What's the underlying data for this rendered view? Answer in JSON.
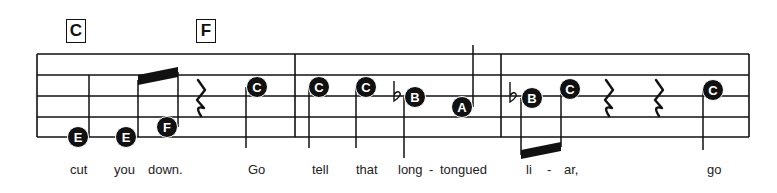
{
  "chords": [
    {
      "label": "C",
      "x": 66,
      "y": 19
    },
    {
      "label": "F",
      "x": 196,
      "y": 19
    }
  ],
  "staff": {
    "left": 37,
    "right": 749,
    "lines_y": [
      54,
      75,
      96,
      117,
      137
    ],
    "barlines_x": [
      37,
      295,
      501,
      749
    ]
  },
  "notes": [
    {
      "name": "E",
      "x": 78,
      "y": 137,
      "stem_x": 89,
      "stem_from": 137,
      "stem_to": 75
    },
    {
      "name": "E",
      "x": 126,
      "y": 137,
      "stem_x": 138,
      "stem_from": 137,
      "stem_to": 80
    },
    {
      "name": "F",
      "x": 167,
      "y": 127,
      "stem_x": 178,
      "stem_from": 127,
      "stem_to": 72
    },
    {
      "name": "C",
      "x": 257,
      "y": 87,
      "stem_x": 246,
      "stem_from": 87,
      "stem_to": 148
    },
    {
      "name": "C",
      "x": 319,
      "y": 87,
      "stem_x": 309,
      "stem_from": 87,
      "stem_to": 148
    },
    {
      "name": "C",
      "x": 366,
      "y": 87,
      "stem_x": 356,
      "stem_from": 87,
      "stem_to": 148
    },
    {
      "name": "B",
      "x": 415,
      "y": 97,
      "stem_x": 404,
      "stem_from": 97,
      "stem_to": 158,
      "flat": true,
      "flat_x": 394
    },
    {
      "name": "A",
      "x": 462,
      "y": 107,
      "stem_x": 473,
      "stem_from": 107,
      "stem_to": 45
    },
    {
      "name": "B",
      "x": 532,
      "y": 98,
      "stem_x": 521,
      "stem_from": 98,
      "stem_to": 155,
      "flat": true,
      "flat_x": 510
    },
    {
      "name": "C",
      "x": 570,
      "y": 89,
      "stem_x": 561,
      "stem_from": 89,
      "stem_to": 147
    },
    {
      "name": "C",
      "x": 713,
      "y": 90,
      "stem_x": 703,
      "stem_from": 90,
      "stem_to": 150
    }
  ],
  "beams": [
    {
      "x1": 138,
      "y1": 75,
      "x2": 178,
      "y2": 67,
      "thickness": 10
    },
    {
      "x1": 521,
      "y1": 150,
      "x2": 561,
      "y2": 142,
      "thickness": 9
    }
  ],
  "rests": [
    {
      "type": "quarter",
      "x": 200
    },
    {
      "type": "quarter",
      "x": 608
    },
    {
      "type": "quarter",
      "x": 658
    }
  ],
  "lyrics": [
    {
      "text": "cut",
      "x": 70
    },
    {
      "text": "you",
      "x": 114
    },
    {
      "text": "down.",
      "x": 148
    },
    {
      "text": "Go",
      "x": 248
    },
    {
      "text": "tell",
      "x": 312
    },
    {
      "text": "that",
      "x": 356
    },
    {
      "text": "long",
      "x": 398
    },
    {
      "text": "-",
      "x": 429
    },
    {
      "text": "tongued",
      "x": 440
    },
    {
      "text": "li",
      "x": 526
    },
    {
      "text": "-",
      "x": 547
    },
    {
      "text": "ar,",
      "x": 564
    },
    {
      "text": "go",
      "x": 707
    }
  ],
  "colors": {
    "ink": "#111111",
    "paper": "#ffffff"
  }
}
